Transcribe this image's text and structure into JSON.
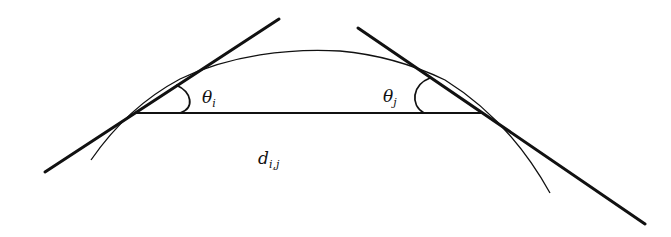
{
  "diagram": {
    "colors": {
      "background": "#ffffff",
      "ink": "#111111"
    },
    "labels": {
      "theta_i": {
        "base": "θ",
        "sub": "i"
      },
      "theta_j": {
        "base": "θ",
        "sub": "j"
      },
      "distance": {
        "base": "d",
        "sub": "i,j"
      }
    },
    "elements": {
      "curve": "arc through points i and j",
      "tangent_i": "tangent line at point i",
      "tangent_j": "tangent line at point j",
      "chord": "segment connecting point i and point j"
    }
  }
}
